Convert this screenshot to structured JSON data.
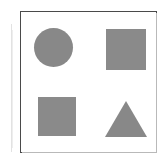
{
  "figure": {
    "background_color": "#ffffff",
    "frame": {
      "border_color": "#4a4a4a",
      "shadow_color": "#b9b9b9",
      "x": 20,
      "y": 11,
      "width": 137,
      "height": 142
    },
    "artifact": {
      "color": "#e2e2e2",
      "secondary_color": "#eeeeee"
    },
    "shape_fill_color": "#888888",
    "shapes": [
      {
        "name": "circle",
        "label": "Circle",
        "position": "top-left",
        "x": 34,
        "y": 28,
        "width": 39,
        "height": 39,
        "color": "#888888"
      },
      {
        "name": "square-top-right",
        "label": "Square",
        "position": "top-right",
        "x": 106,
        "y": 29,
        "width": 40,
        "height": 41,
        "color": "#8a8a8a"
      },
      {
        "name": "square-bottom-left",
        "label": "Square",
        "position": "bottom-left",
        "x": 38,
        "y": 97,
        "width": 38,
        "height": 39,
        "color": "#8a8a8a"
      },
      {
        "name": "triangle",
        "label": "Triangle",
        "position": "bottom-right",
        "apex_x": 126,
        "base_left_x": 105,
        "base_right_x": 147,
        "top_y": 101,
        "base_y": 137,
        "width": 42,
        "height": 36,
        "color": "#888888"
      }
    ]
  }
}
